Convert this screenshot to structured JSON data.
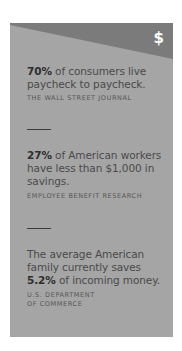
{
  "card": {
    "icon": "$",
    "colors": {
      "band": "#7b7b7b",
      "body": "#a5a5a5",
      "text": "#4a4a4a",
      "icon": "#ffffff"
    }
  },
  "facts": [
    {
      "highlight": "70%",
      "text_before": "",
      "text_after": " of consumers live paycheck to paycheck.",
      "source": "The Wall Street Journal"
    },
    {
      "highlight": "27%",
      "text_before": "",
      "text_after": " of American workers have less than $1,000 in savings.",
      "source": "Employee Benefit Research"
    },
    {
      "highlight": "5.2%",
      "text_before": "The average American family currently saves ",
      "text_after": " of incoming money.",
      "source_line1": "U.S. Department",
      "source_line2": "of Commerce"
    }
  ]
}
